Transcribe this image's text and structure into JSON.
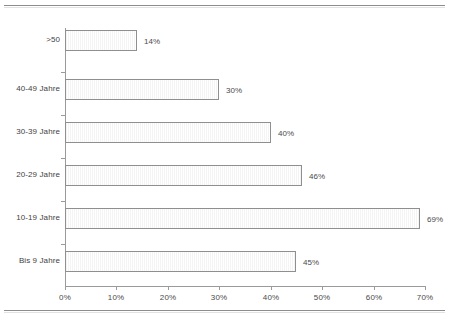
{
  "chart_data": {
    "type": "bar",
    "orientation": "horizontal",
    "title": "",
    "xlabel": "",
    "ylabel": "",
    "categories": [
      "Bis 9 Jahre",
      "10-19 Jahre",
      "20-29 Jahre",
      "30-39 Jahre",
      "40-49 Jahre",
      ">50"
    ],
    "values": [
      45,
      69,
      46,
      40,
      30,
      14
    ],
    "value_labels": [
      "45%",
      "69%",
      "46%",
      "40%",
      "30%",
      "14%"
    ],
    "xlim": [
      0,
      70
    ],
    "xticks": [
      0,
      10,
      20,
      30,
      40,
      50,
      60,
      70
    ],
    "xtick_labels": [
      "0%",
      "10%",
      "20%",
      "30%",
      "40%",
      "50%",
      "60%",
      "70%"
    ],
    "grid": false,
    "legend": false,
    "bar_fill": "#f2f2f2",
    "bar_border": "#8f8f8f",
    "axis_color": "#9a9a9a",
    "text_color": "#4a4a4a"
  }
}
